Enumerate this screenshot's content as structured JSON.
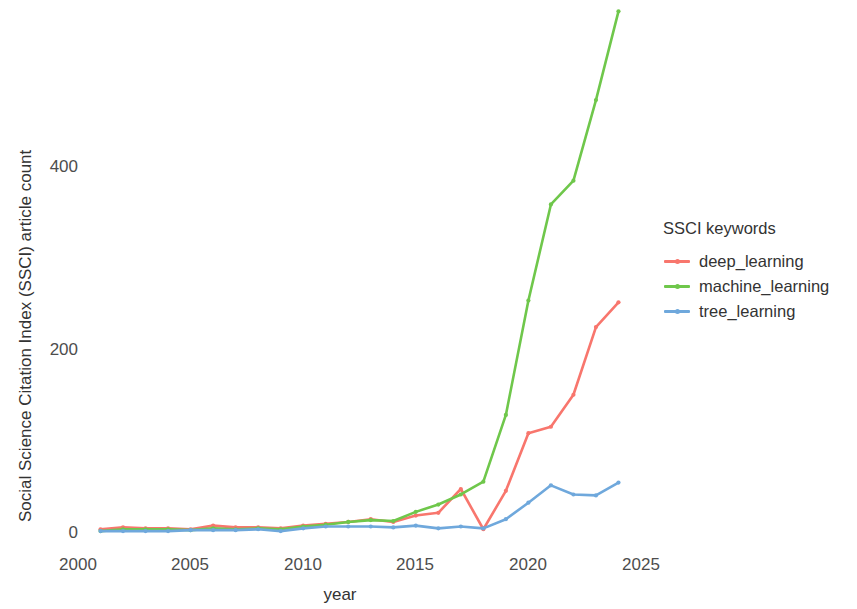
{
  "chart_data": {
    "type": "line",
    "title": "",
    "xlabel": "year",
    "ylabel": "Social Science Citation Index (SSCI) article count",
    "xlim": [
      2000,
      2026
    ],
    "ylim": [
      0,
      580
    ],
    "xticks": [
      2000,
      2005,
      2010,
      2015,
      2020,
      2025
    ],
    "yticks": [
      0,
      200,
      400
    ],
    "grid": false,
    "legend_position": "right",
    "legend_title": "SSCI keywords",
    "x": [
      2001,
      2002,
      2003,
      2004,
      2005,
      2006,
      2007,
      2008,
      2009,
      2010,
      2011,
      2012,
      2013,
      2014,
      2015,
      2016,
      2017,
      2018,
      2019,
      2020,
      2021,
      2022,
      2023,
      2024
    ],
    "series": [
      {
        "name": "deep_learning",
        "color": "#F8766D",
        "values": [
          3,
          5,
          4,
          4,
          3,
          7,
          5,
          5,
          4,
          7,
          9,
          11,
          14,
          11,
          18,
          21,
          47,
          3,
          45,
          108,
          115,
          150,
          224,
          251
        ]
      },
      {
        "name": "machine_learning",
        "color": "#6FC74B",
        "values": [
          1,
          3,
          3,
          3,
          2,
          4,
          3,
          4,
          3,
          6,
          8,
          11,
          13,
          12,
          22,
          30,
          41,
          55,
          128,
          253,
          358,
          384,
          472,
          569
        ]
      },
      {
        "name": "tree_learning",
        "color": "#6FA8DC",
        "values": [
          1,
          1,
          1,
          1,
          2,
          2,
          2,
          3,
          1,
          4,
          6,
          6,
          6,
          5,
          7,
          4,
          6,
          4,
          14,
          32,
          51,
          41,
          40,
          54
        ]
      }
    ]
  },
  "axes": {
    "y_title": "Social Science Citation Index (SSCI) article count",
    "x_title": "year",
    "y_tick_labels": [
      "400",
      "200",
      "0"
    ],
    "x_tick_labels": [
      "2000",
      "2005",
      "2010",
      "2015",
      "2020",
      "2025"
    ]
  },
  "legend": {
    "title": "SSCI keywords",
    "entries": [
      {
        "label": "deep_learning",
        "color": "#F8766D"
      },
      {
        "label": "machine_learning",
        "color": "#6FC74B"
      },
      {
        "label": "tree_learning",
        "color": "#6FA8DC"
      }
    ]
  }
}
